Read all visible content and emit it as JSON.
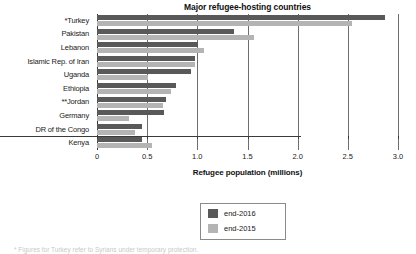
{
  "chart_data": {
    "type": "bar",
    "orientation": "horizontal",
    "title": "Major refugee-hosting countries",
    "xlabel": "Refugee population (millions)",
    "ylabel": "",
    "xlim": [
      0,
      3.0
    ],
    "xticks": [
      "0",
      "0.5",
      "1.0",
      "1.5",
      "2.0",
      "2.5",
      "3.0"
    ],
    "xtick_values": [
      0,
      0.5,
      1.0,
      1.5,
      2.0,
      2.5,
      3.0
    ],
    "grid": "vertical",
    "legend_position": "below-center",
    "categories": [
      "*Turkey",
      "Pakistan",
      "Lebanon",
      "Islamic Rep. of Iran",
      "Uganda",
      "Ethiopia",
      "**Jordan",
      "Germany",
      "DR of the Congo",
      "Kenya"
    ],
    "series": [
      {
        "name": "end-2016",
        "color": "#595959",
        "values": [
          2.87,
          1.37,
          1.01,
          0.98,
          0.94,
          0.79,
          0.69,
          0.67,
          0.45,
          0.45
        ]
      },
      {
        "name": "end-2015",
        "color": "#b4b4b4",
        "values": [
          2.54,
          1.56,
          1.07,
          0.98,
          0.51,
          0.74,
          0.66,
          0.32,
          0.38,
          0.55
        ]
      }
    ]
  },
  "footnote": {
    "text": "* Figures for Turkey refer to Syrians under temporary protection."
  }
}
